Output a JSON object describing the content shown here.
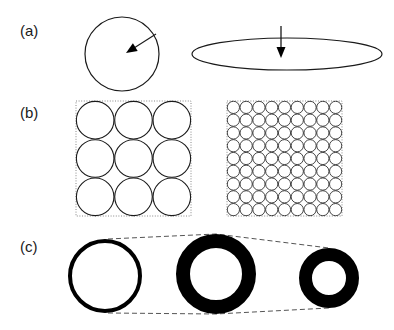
{
  "figure": {
    "width": 394,
    "height": 330,
    "background": "#ffffff",
    "stroke_color": "#1a1a1a",
    "fill_color": "#000000",
    "dashed_color": "#555555"
  },
  "panels": [
    {
      "id": "a",
      "label": "(a)",
      "label_x": 20,
      "label_y": 36,
      "description": "A circle with a radius arrow and a flat ellipse with a vertical semi-axis arrow",
      "shapes": [
        {
          "name": "circle-outline",
          "type": "circle",
          "cx": 122,
          "cy": 54,
          "r": 37,
          "stroke_width": 1.2,
          "fill": "none"
        },
        {
          "name": "radius-arrow",
          "type": "arrow",
          "x1": 156,
          "y1": 34,
          "x2": 126,
          "y2": 53,
          "head_length": 11,
          "head_width": 9,
          "stroke_width": 1.1
        },
        {
          "name": "ellipse-outline",
          "type": "ellipse",
          "cx": 287,
          "cy": 54,
          "rx": 95,
          "ry": 16,
          "stroke_width": 1.2,
          "fill": "none"
        },
        {
          "name": "semi-axis-arrow",
          "type": "arrow",
          "x1": 281,
          "y1": 26,
          "x2": 281,
          "y2": 58,
          "head_length": 11,
          "head_width": 9,
          "stroke_width": 1.3
        }
      ]
    },
    {
      "id": "b",
      "label": "(b)",
      "label_x": 20,
      "label_y": 118,
      "description": "Two equal squares packed with circles: coarse 3 by 3 packing and fine 9 by 9 packing",
      "boxes": [
        {
          "name": "coarse-packing-box",
          "x": 76,
          "y": 101,
          "size": 115,
          "grid": 3,
          "circle_stroke_width": 1.1,
          "border_style": "dotted",
          "border_color": "#888888"
        },
        {
          "name": "fine-packing-box",
          "x": 227,
          "y": 101,
          "size": 115,
          "grid": 9,
          "circle_stroke_width": 0.8,
          "border_style": "dotted",
          "border_color": "#888888"
        }
      ]
    },
    {
      "id": "c",
      "label": "(c)",
      "label_x": 20,
      "label_y": 252,
      "description": "Three annular rings of decreasing outer size and increasing wall thickness, joined by dashed envelope lines",
      "rings": [
        {
          "name": "ring-thin",
          "cx": 105,
          "cy": 276,
          "outer_r": 37,
          "wall": 4
        },
        {
          "name": "ring-medium",
          "cx": 216,
          "cy": 274,
          "outer_r": 40,
          "wall": 14
        },
        {
          "name": "ring-thick",
          "cx": 329,
          "cy": 278,
          "outer_r": 30,
          "wall": 13
        }
      ],
      "envelope": {
        "name": "dashed-envelope",
        "stroke_width": 1,
        "dash_pattern": "5,3",
        "top_points": "108,239 216,234 329,248",
        "bottom_points": "108,313 216,314 329,308"
      }
    }
  ]
}
